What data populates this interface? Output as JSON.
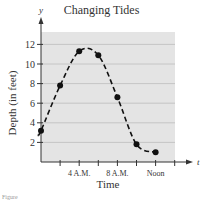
{
  "chart_data": {
    "type": "line",
    "title": "Changing Tides",
    "xlabel": "Time",
    "ylabel": "Depth (in feet)",
    "x_axis_symbol": "t",
    "y_axis_symbol": "y",
    "x_ticks": [
      2,
      4,
      6,
      8,
      10,
      12,
      14
    ],
    "x_tick_labels": [
      {
        "value": 4,
        "label": "4 A.M."
      },
      {
        "value": 8,
        "label": "8 A.M."
      },
      {
        "value": 12,
        "label": "Noon"
      }
    ],
    "y_ticks": [
      2,
      4,
      6,
      8,
      10,
      12
    ],
    "xlim": [
      0,
      15
    ],
    "ylim": [
      0,
      13
    ],
    "grid": "horizontal",
    "background": "#e6e6e6",
    "series": [
      {
        "name": "Tide depth",
        "style": "dashed curve with markers",
        "x": [
          0,
          2,
          4,
          6,
          8,
          10,
          12
        ],
        "values": [
          3.2,
          7.8,
          11.3,
          10.9,
          6.6,
          1.8,
          1.0
        ]
      }
    ]
  },
  "caption": "Figure"
}
